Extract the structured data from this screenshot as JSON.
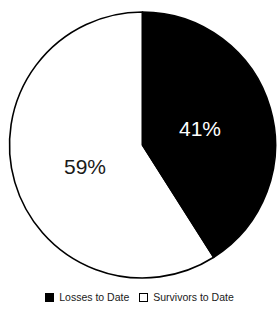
{
  "chart_data": {
    "type": "pie",
    "title": "",
    "categories": [
      "Losses to Date",
      "Survivors to Date"
    ],
    "values": [
      41,
      59
    ],
    "value_unit": "%",
    "data_labels": [
      "41%",
      "59%"
    ],
    "colors": [
      "#000000",
      "#FFFFFF"
    ],
    "label_colors": [
      "#FFFFFF",
      "#1A1A1A"
    ],
    "outline_color": "#000000",
    "start_angle_deg": 0,
    "direction": "clockwise",
    "legend_position": "bottom",
    "grid": false,
    "xlabel": "",
    "ylabel": ""
  },
  "labels": {
    "losses": "41%",
    "survivors": "59%"
  },
  "legend": {
    "entries": [
      {
        "label": "Losses to Date",
        "swatch": "filled-square-icon"
      },
      {
        "label": "Survivors to Date",
        "swatch": "outlined-square-icon"
      }
    ]
  }
}
